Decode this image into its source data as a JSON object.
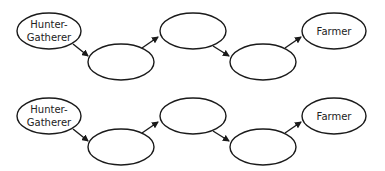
{
  "diagram": {
    "type": "flow-sequence",
    "stroke_color": "#1a1a1a",
    "fill_color": "#ffffff",
    "rows": [
      {
        "nodes": [
          {
            "label_lines": [
              "Hunter-",
              "Gatherer"
            ]
          },
          {
            "label_lines": []
          },
          {
            "label_lines": []
          },
          {
            "label_lines": []
          },
          {
            "label_lines": [
              "Farmer"
            ]
          }
        ]
      },
      {
        "nodes": [
          {
            "label_lines": [
              "Hunter-",
              "Gatherer"
            ]
          },
          {
            "label_lines": []
          },
          {
            "label_lines": []
          },
          {
            "label_lines": []
          },
          {
            "label_lines": [
              "Farmer"
            ]
          }
        ]
      }
    ]
  }
}
